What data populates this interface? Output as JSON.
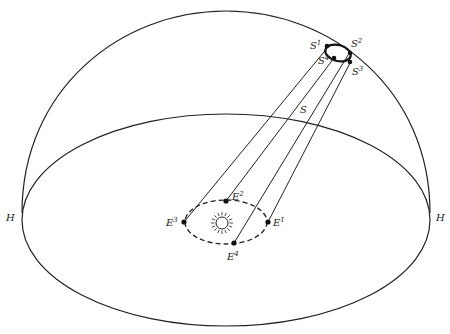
{
  "diagram": {
    "horizon_labels": {
      "left": "H",
      "right": "H"
    },
    "star": {
      "label": "S"
    },
    "apparent_positions": [
      {
        "base": "S",
        "sup": "1"
      },
      {
        "base": "S",
        "sup": "2"
      },
      {
        "base": "S",
        "sup": "3"
      },
      {
        "base": "S",
        "sup": "4"
      }
    ],
    "earth_positions": [
      {
        "base": "E",
        "sup": "1"
      },
      {
        "base": "E",
        "sup": "2"
      },
      {
        "base": "E",
        "sup": "3"
      },
      {
        "base": "E",
        "sup": "4"
      }
    ],
    "center_symbol": "sun-icon",
    "colors": {
      "line": "#222222",
      "background": "#ffffff"
    }
  }
}
